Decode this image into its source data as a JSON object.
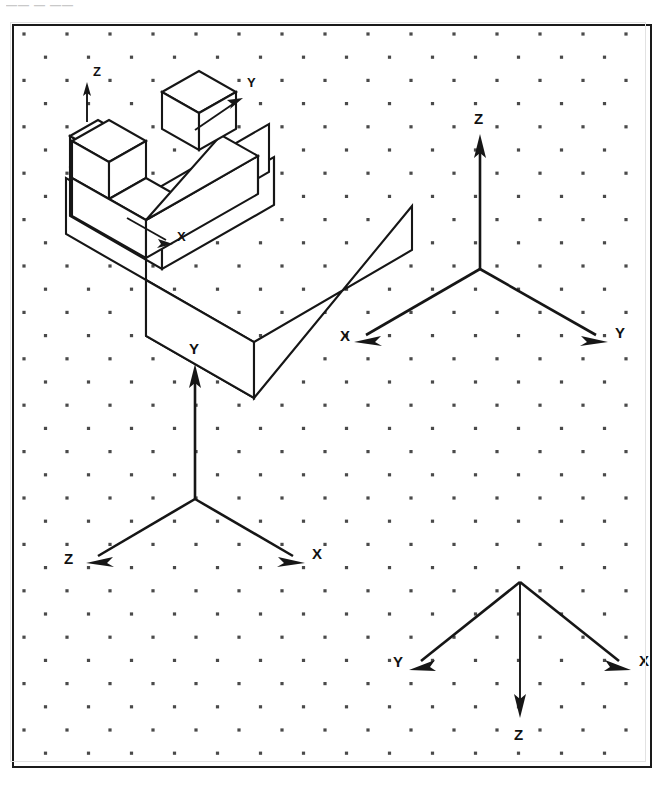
{
  "scan_header": {
    "text": "—— — ——"
  },
  "page": {
    "background_color": "#ffffff",
    "line_color": "#161616",
    "dot_color": "#4a4a4a",
    "border_color": "#1a1a1a"
  },
  "grid": {
    "type": "isometric-dot-grid",
    "origin_x": 10,
    "origin_y": 8,
    "col_spacing": 43,
    "row_spacing": 23.2,
    "row_offset": 21.5,
    "dot_radius": 1.6,
    "cols": 16,
    "rows": 33
  },
  "pictorial": {
    "name": "stepped-block",
    "description": "Isometric pictorial of an L-shaped stepped block with a cube boss on the upper surface",
    "axes": [
      {
        "label": "Z",
        "direction": "up",
        "label_x": 78,
        "label_y": 44
      },
      {
        "label": "Y",
        "direction": "upper-right",
        "label_x": 222,
        "label_y": 55
      },
      {
        "label": "X",
        "direction": "lower-right",
        "label_x": 162,
        "label_y": 207
      }
    ]
  },
  "axis_systems": [
    {
      "name": "axis-system-upper-right",
      "position": "upper-right",
      "origin_x": 466,
      "origin_y": 267,
      "axes": [
        {
          "label": "Z",
          "direction": "up",
          "label_x": 466,
          "label_y": 113
        },
        {
          "label": "Y",
          "direction": "lower-right",
          "label_x": 617,
          "label_y": 331
        },
        {
          "label": "X",
          "direction": "lower-left",
          "label_x": 344,
          "label_y": 334
        }
      ]
    },
    {
      "name": "axis-system-middle-left",
      "position": "middle-left",
      "origin_x": 181,
      "origin_y": 497,
      "axes": [
        {
          "label": "Y",
          "direction": "up",
          "label_x": 170,
          "label_y": 354
        },
        {
          "label": "X",
          "direction": "lower-right",
          "label_x": 310,
          "label_y": 562
        },
        {
          "label": "Z",
          "direction": "lower-left",
          "label_x": 38,
          "label_y": 564
        }
      ]
    },
    {
      "name": "axis-system-bottom-right",
      "position": "bottom-right",
      "origin_x": 506,
      "origin_y": 580,
      "axes": [
        {
          "label": "Z",
          "direction": "down",
          "label_x": 506,
          "label_y": 736
        },
        {
          "label": "X",
          "direction": "lower-right",
          "label_x": 633,
          "label_y": 656
        },
        {
          "label": "Y",
          "direction": "lower-left",
          "label_x": 388,
          "label_y": 658
        }
      ]
    }
  ]
}
